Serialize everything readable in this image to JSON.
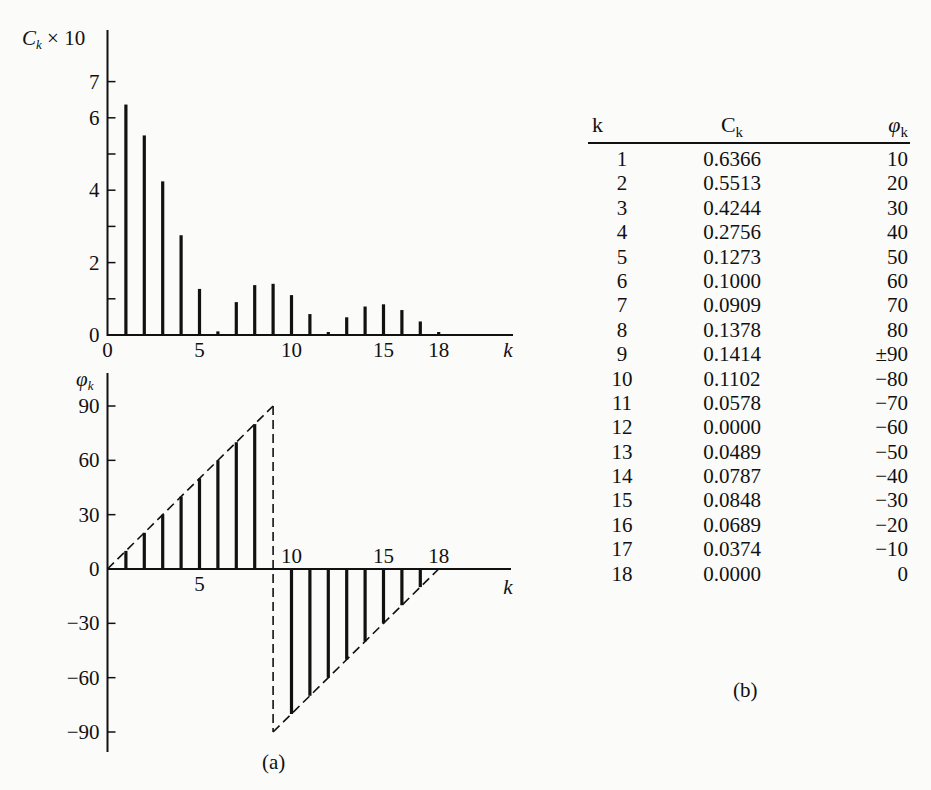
{
  "figure_a": {
    "caption": "(a)",
    "top_chart": {
      "ylabel": "Cₖ × 10",
      "yticks": [
        0,
        2,
        4,
        6,
        7
      ],
      "xticks": [
        0,
        5,
        10,
        15,
        18
      ],
      "xlabel": "k"
    },
    "bottom_chart": {
      "ylabel": "φₖ",
      "yticks": [
        90,
        60,
        30,
        0,
        -30,
        -60,
        -90
      ],
      "xticks_above": [
        10,
        15,
        18
      ],
      "xticks_below": [
        5
      ],
      "xlabel": "k"
    }
  },
  "table_b": {
    "caption": "(b)",
    "headers": {
      "k": "k",
      "c": "C",
      "c_sub": "k",
      "phi": "φ",
      "phi_sub": "k"
    },
    "rows": [
      {
        "k": "1",
        "c": "0.6366",
        "phi": "10"
      },
      {
        "k": "2",
        "c": "0.5513",
        "phi": "20"
      },
      {
        "k": "3",
        "c": "0.4244",
        "phi": "30"
      },
      {
        "k": "4",
        "c": "0.2756",
        "phi": "40"
      },
      {
        "k": "5",
        "c": "0.1273",
        "phi": "50"
      },
      {
        "k": "6",
        "c": "0.1000",
        "phi": "60"
      },
      {
        "k": "7",
        "c": "0.0909",
        "phi": "70"
      },
      {
        "k": "8",
        "c": "0.1378",
        "phi": "80"
      },
      {
        "k": "9",
        "c": "0.1414",
        "phi": "±90"
      },
      {
        "k": "10",
        "c": "0.1102",
        "phi": "−80"
      },
      {
        "k": "11",
        "c": "0.0578",
        "phi": "−70"
      },
      {
        "k": "12",
        "c": "0.0000",
        "phi": "−60"
      },
      {
        "k": "13",
        "c": "0.0489",
        "phi": "−50"
      },
      {
        "k": "14",
        "c": "0.0787",
        "phi": "−40"
      },
      {
        "k": "15",
        "c": "0.0848",
        "phi": "−30"
      },
      {
        "k": "16",
        "c": "0.0689",
        "phi": "−20"
      },
      {
        "k": "17",
        "c": "0.0374",
        "phi": "−10"
      },
      {
        "k": "18",
        "c": "0.0000",
        "phi": "0"
      }
    ]
  },
  "chart_data": [
    {
      "type": "bar",
      "title": "",
      "xlabel": "k",
      "ylabel": "Ck × 10",
      "x": [
        1,
        2,
        3,
        4,
        5,
        6,
        7,
        8,
        9,
        10,
        11,
        12,
        13,
        14,
        15,
        16,
        17,
        18
      ],
      "values": [
        6.366,
        5.513,
        4.244,
        2.756,
        1.273,
        0.1,
        0.909,
        1.378,
        1.414,
        1.102,
        0.578,
        0.0,
        0.489,
        0.787,
        0.848,
        0.689,
        0.374,
        0.0
      ],
      "ylim": [
        0,
        10
      ],
      "yticks": [
        0,
        1,
        2,
        3,
        4,
        5,
        6,
        7
      ],
      "ytick_labels": [
        "0",
        "2",
        "4",
        "6",
        "7"
      ],
      "xtick_labels": [
        "0",
        "5",
        "10",
        "15",
        "18"
      ],
      "grid": false
    },
    {
      "type": "bar",
      "title": "",
      "xlabel": "k",
      "ylabel": "φk",
      "x": [
        1,
        2,
        3,
        4,
        5,
        6,
        7,
        8,
        9,
        10,
        11,
        12,
        13,
        14,
        15,
        16,
        17,
        18
      ],
      "values": [
        10,
        20,
        30,
        40,
        50,
        60,
        70,
        80,
        90,
        -80,
        -70,
        -60,
        -50,
        -40,
        -30,
        -20,
        -10,
        0
      ],
      "ylim": [
        -90,
        90
      ],
      "ytick_labels": [
        "90",
        "60",
        "30",
        "0",
        "−30",
        "−60",
        "−90"
      ],
      "xtick_labels": [
        "5",
        "10",
        "15",
        "18"
      ],
      "annotations": [
        "dashed envelope line from (0,0) to (9,90)",
        "dashed vertical at k=9 from +90 to −90",
        "dashed envelope from (9,−90) to (18,0)"
      ],
      "grid": false
    },
    {
      "type": "table",
      "columns": [
        "k",
        "Ck",
        "φk"
      ],
      "rows": [
        [
          1,
          0.6366,
          "10"
        ],
        [
          2,
          0.5513,
          "20"
        ],
        [
          3,
          0.4244,
          "30"
        ],
        [
          4,
          0.2756,
          "40"
        ],
        [
          5,
          0.1273,
          "50"
        ],
        [
          6,
          0.1,
          "60"
        ],
        [
          7,
          0.0909,
          "70"
        ],
        [
          8,
          0.1378,
          "80"
        ],
        [
          9,
          0.1414,
          "±90"
        ],
        [
          10,
          0.1102,
          "−80"
        ],
        [
          11,
          0.0578,
          "−70"
        ],
        [
          12,
          0.0,
          "−60"
        ],
        [
          13,
          0.0489,
          "−50"
        ],
        [
          14,
          0.0787,
          "−40"
        ],
        [
          15,
          0.0848,
          "−30"
        ],
        [
          16,
          0.0689,
          "−20"
        ],
        [
          17,
          0.0374,
          "−10"
        ],
        [
          18,
          0.0,
          "0"
        ]
      ]
    }
  ]
}
